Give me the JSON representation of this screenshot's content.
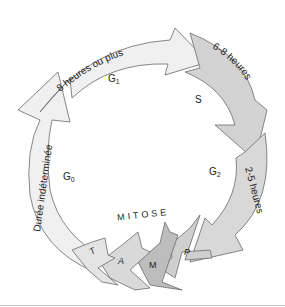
{
  "diagram": {
    "phases": [
      {
        "id": "G1",
        "label": "G",
        "sub": "1",
        "duration": "8 heures ou plus",
        "fill": "#f0f0f0"
      },
      {
        "id": "S",
        "label": "S",
        "duration": "6-8 heures",
        "fill": "#d2d2d2"
      },
      {
        "id": "G2",
        "label": "G",
        "sub": "2",
        "duration": "2-5 heures",
        "fill": "#d8d8d8"
      },
      {
        "id": "G0",
        "label": "G",
        "sub": "0",
        "duration": "Durée indéterminée",
        "fill": "#f0f0f0"
      }
    ],
    "mitosis": {
      "label": "MITOSE",
      "stages": [
        {
          "id": "P",
          "label": "P",
          "fill": "#cfcfcf"
        },
        {
          "id": "M",
          "label": "M",
          "fill": "#bdbdbd"
        },
        {
          "id": "A",
          "label": "A",
          "fill": "#d9d9d9"
        },
        {
          "id": "T",
          "label": "T",
          "fill": "#e4e4e4"
        }
      ]
    },
    "stroke": "#6a6a6a"
  }
}
